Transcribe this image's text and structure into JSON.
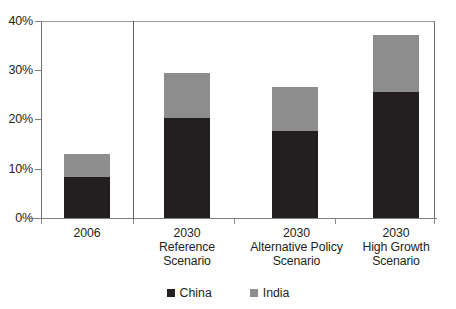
{
  "chart_data": {
    "type": "bar",
    "subtype": "stacked-bar",
    "title": "",
    "xlabel": "",
    "ylabel": "",
    "ylim": [
      0,
      40
    ],
    "yticks": [
      0,
      10,
      20,
      30,
      40
    ],
    "ytick_labels": [
      "0%",
      "10%",
      "20%",
      "30%",
      "40%"
    ],
    "grid": false,
    "legend_position": "bottom-center",
    "categories": [
      "2006",
      "2030 Reference Scenario",
      "2030 Alternative Policy Scenario",
      "2030 High Growth Scenario"
    ],
    "category_lines": [
      [
        "2006"
      ],
      [
        "2030",
        "Reference",
        "Scenario"
      ],
      [
        "2030",
        "Alternative Policy",
        "Scenario"
      ],
      [
        "2030",
        "High Growth",
        "Scenario"
      ]
    ],
    "series": [
      {
        "name": "China",
        "color": "#231f20",
        "values": [
          8.3,
          20.4,
          17.7,
          25.6
        ]
      },
      {
        "name": "India",
        "color": "#8d8d8d",
        "values": [
          4.7,
          9.1,
          9.0,
          11.5
        ]
      }
    ],
    "totals": [
      13.0,
      29.5,
      26.7,
      37.1
    ],
    "annotations": [
      "vertical separator between 2006 and the 2030 scenario group"
    ]
  },
  "axis": {
    "ytick_labels": [
      "40%",
      "30%",
      "20%",
      "10%",
      "0%"
    ]
  },
  "legend": {
    "entries": [
      {
        "label": "China",
        "color": "#231f20"
      },
      {
        "label": "India",
        "color": "#8d8d8d"
      }
    ]
  }
}
